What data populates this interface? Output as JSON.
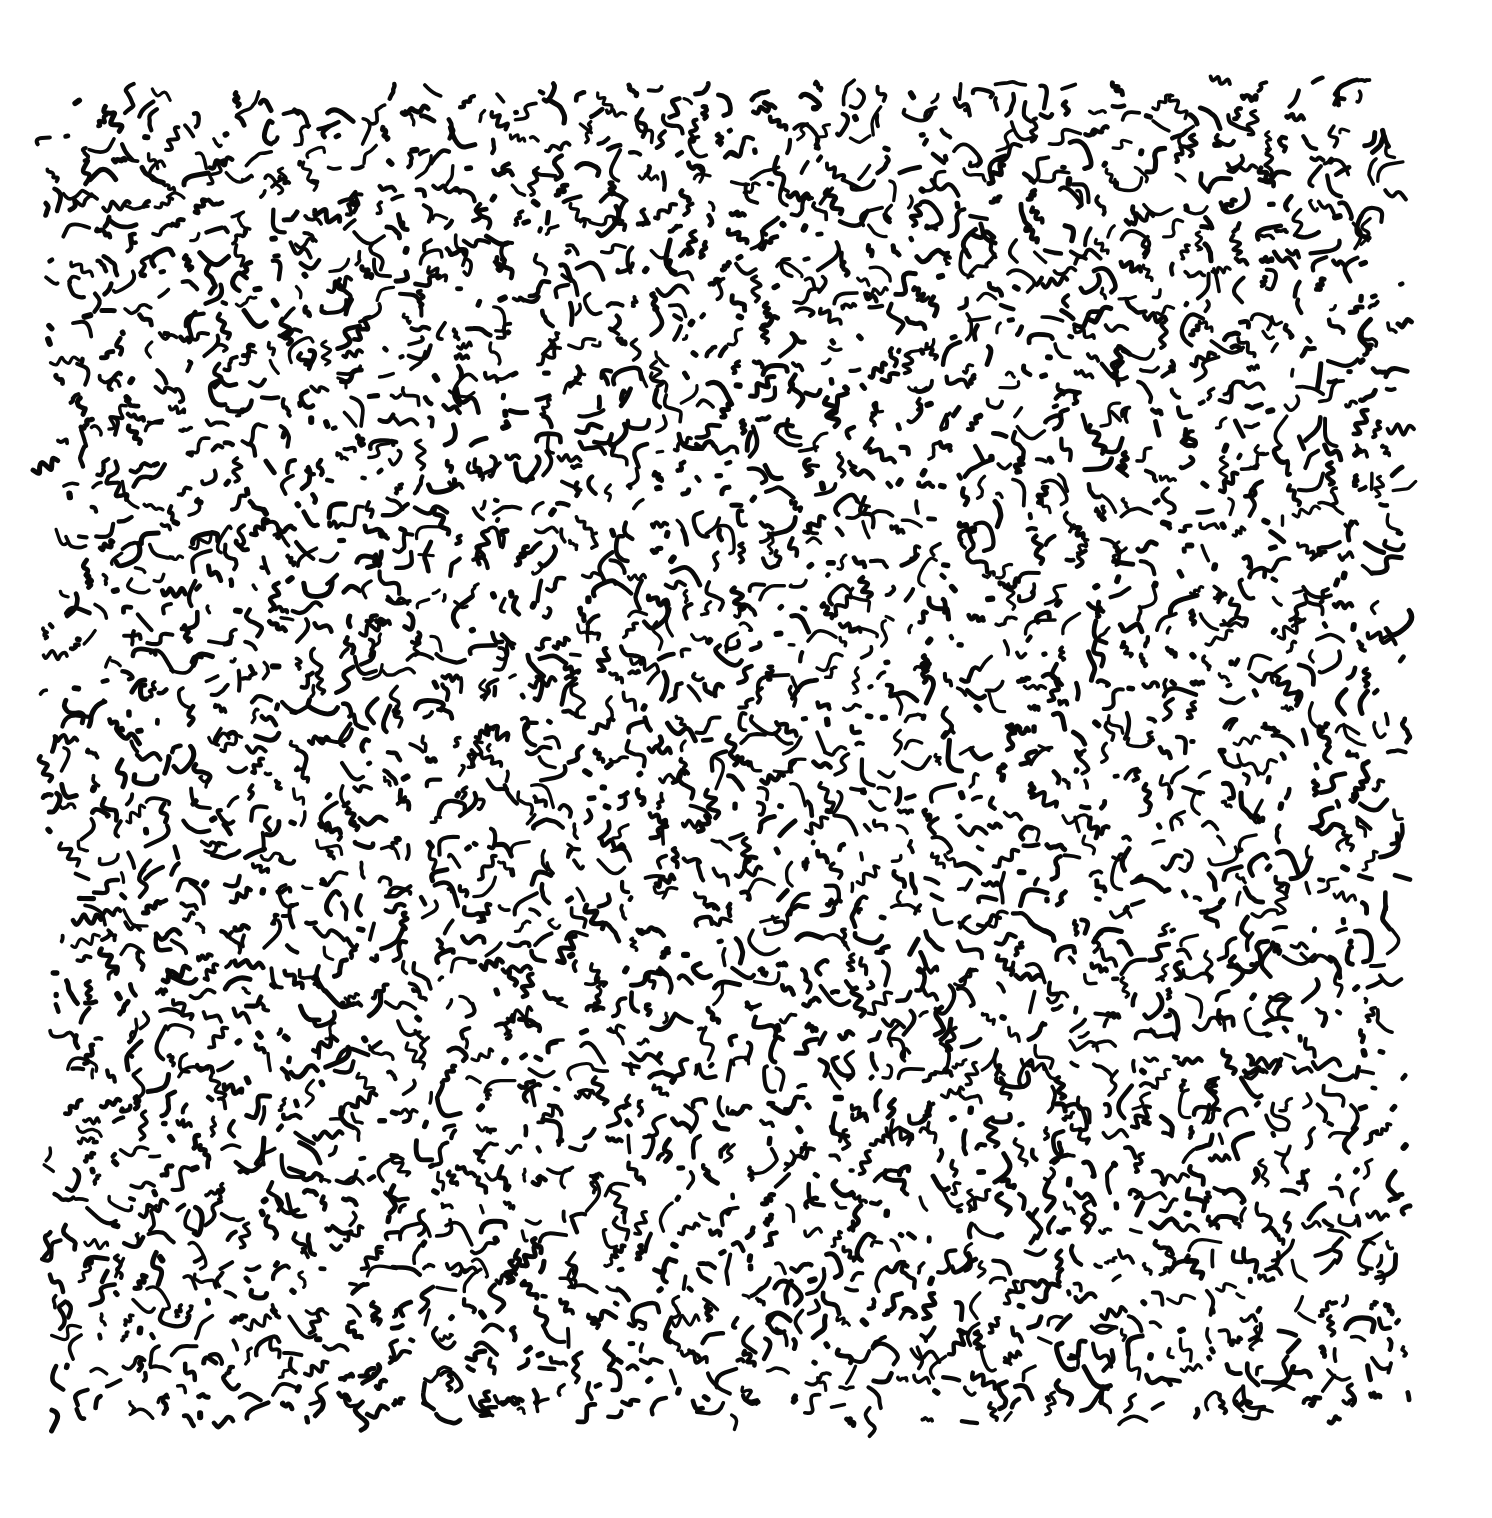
{
  "artwork": {
    "description": "Abstract ink drawing: dense field of short hand-drawn black squiggles on white paper",
    "background_color": "#ffffff",
    "ink_color": "#0a0a0a",
    "canvas": {
      "width": 1492,
      "height": 1518
    },
    "field": {
      "top_left": [
        42,
        95
      ],
      "top_right": [
        1405,
        75
      ],
      "bottom_right": [
        1412,
        1425
      ],
      "bottom_left": [
        45,
        1422
      ]
    },
    "stroke": {
      "width_min": 3.2,
      "width_max": 5.2,
      "length_min": 9,
      "length_max": 30,
      "cell_size": 22,
      "jitter": 0.55,
      "dot_probability": 0.05,
      "shapes": [
        "arc",
        "zigzag",
        "s-curve",
        "hook",
        "dash",
        "dot",
        "wave"
      ]
    },
    "seed": 20240611
  }
}
